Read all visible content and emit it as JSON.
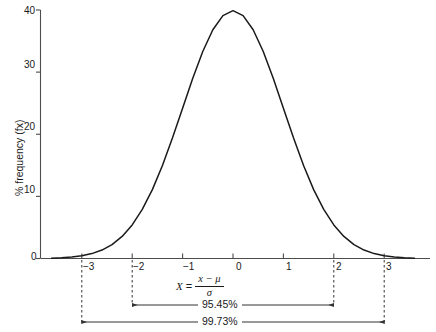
{
  "chart_data": {
    "type": "line",
    "title": "",
    "subtitle": "",
    "xlabel": "X = (x - μ) / σ",
    "ylabel": "% frequency (fx)",
    "xlim": [
      -3.6,
      3.6
    ],
    "ylim": [
      0,
      40
    ],
    "grid": false,
    "legend": null,
    "distribution": "standard normal (Gaussian), percent frequency scale, peak 39.894 at x=0",
    "x_ticks": [
      -3,
      -2,
      -1,
      0,
      1,
      2,
      3
    ],
    "x_tick_labels": [
      "−3",
      "−2",
      "−1",
      "0",
      "1",
      "2",
      "3"
    ],
    "y_ticks": [
      0,
      10,
      20,
      30,
      40
    ],
    "y_tick_labels": [
      "0",
      "10",
      "20",
      "30",
      "40"
    ],
    "series": [
      {
        "name": "normal curve",
        "x": [
          -3.6,
          -3.4,
          -3.2,
          -3.0,
          -2.8,
          -2.6,
          -2.4,
          -2.2,
          -2.0,
          -1.8,
          -1.6,
          -1.4,
          -1.2,
          -1.0,
          -0.8,
          -0.6,
          -0.4,
          -0.2,
          0.0,
          0.2,
          0.4,
          0.6,
          0.8,
          1.0,
          1.2,
          1.4,
          1.6,
          1.8,
          2.0,
          2.2,
          2.4,
          2.6,
          2.8,
          3.0,
          3.2,
          3.4,
          3.6
        ],
        "values": [
          0.06,
          0.12,
          0.24,
          0.44,
          0.79,
          1.36,
          2.24,
          3.55,
          5.4,
          7.9,
          11.09,
          14.97,
          19.42,
          24.2,
          28.97,
          33.32,
          36.83,
          39.1,
          39.89,
          39.1,
          36.83,
          33.32,
          28.97,
          24.2,
          19.42,
          14.97,
          11.09,
          7.9,
          5.4,
          3.55,
          2.24,
          1.36,
          0.79,
          0.44,
          0.24,
          0.12,
          0.06
        ]
      }
    ],
    "annotations": [
      {
        "label": "95.45%",
        "from": -2,
        "to": 2,
        "type": "double-arrow"
      },
      {
        "label": "99.73%",
        "from": -3,
        "to": 3,
        "type": "double-arrow"
      }
    ],
    "droplines": [
      -3,
      -2,
      2,
      3
    ]
  },
  "axes": {
    "y_label": "% frequency (fx)",
    "y_tick_labels": [
      "40",
      "30",
      "20",
      "10",
      "0"
    ],
    "x_tick_labels": [
      "−3",
      "−2",
      "−1",
      "0",
      "1",
      "2",
      "3"
    ]
  },
  "formula": {
    "lhs": "X",
    "equals": "=",
    "numerator": "x − μ",
    "denominator": "σ"
  },
  "annotations": {
    "inner_label": "95.45%",
    "outer_label": "99.73%"
  },
  "colors": {
    "curve": "#1a1a1a",
    "axis": "#4d4d4d",
    "annotation": "#333333",
    "background": "#ffffff"
  }
}
